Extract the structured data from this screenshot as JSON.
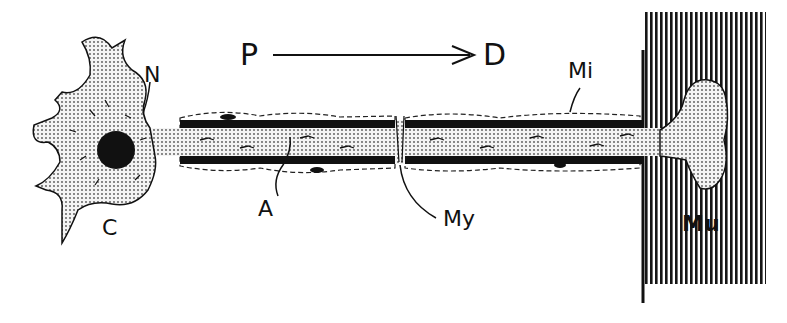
{
  "diagram": {
    "direction": {
      "from_label": "P",
      "to_label": "D"
    },
    "labels": {
      "cell_body": "C",
      "nucleus": "N",
      "axon": "A",
      "myelin": "My",
      "mitochondria": "Mi",
      "muscle": "Mu"
    },
    "colors": {
      "ink": "#111111",
      "background": "#ffffff",
      "stipple": "#d9d9d9"
    }
  }
}
